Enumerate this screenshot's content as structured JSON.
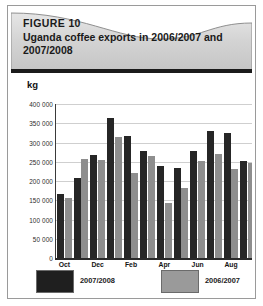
{
  "figure": {
    "label": "FIGURE 10",
    "title": "Uganda coffee exports in 2006/2007 and 2007/2008",
    "unit": "kg"
  },
  "colors": {
    "series_2007_2008": "#262626",
    "series_2006_2007": "#8e8e8e",
    "header_band": "#d2d2d2",
    "header_rule": "#1b1b1b",
    "gridline": "#cfcfcf",
    "axis": "#2a2a2a"
  },
  "legend": {
    "position": "bottom",
    "items": [
      {
        "label": "2007/2008",
        "swatch": "dark"
      },
      {
        "label": "2006/2007",
        "swatch": "gray"
      }
    ]
  },
  "chart_data": {
    "type": "bar",
    "title": "Uganda coffee exports in 2006/2007 and 2007/2008",
    "xlabel": "",
    "ylabel": "kg",
    "ylim": [
      0,
      400000
    ],
    "ytick_step": 50000,
    "ytick_labels": [
      "400 000",
      "350 000",
      "300 000",
      "250 000",
      "200 000",
      "150 000",
      "100 000",
      "50 000",
      "0"
    ],
    "ytick_values": [
      400000,
      350000,
      300000,
      250000,
      200000,
      150000,
      100000,
      50000,
      0
    ],
    "grid": true,
    "legend_position": "bottom",
    "categories": [
      "Oct",
      "Nov",
      "Dec",
      "Jan",
      "Feb",
      "Mar",
      "Apr",
      "May",
      "Jun",
      "Jul",
      "Aug",
      "Sep"
    ],
    "xtick_labels_shown": [
      "Oct",
      "Dec",
      "Feb",
      "Apr",
      "Jun",
      "Aug"
    ],
    "series": [
      {
        "name": "2007/2008",
        "color": "#262626",
        "values": [
          167000,
          207000,
          267000,
          364000,
          318000,
          277000,
          239000,
          233000,
          278000,
          329000,
          324000,
          252000
        ]
      },
      {
        "name": "2006/2007",
        "color": "#8e8e8e",
        "values": [
          157000,
          257000,
          255000,
          315000,
          220000,
          265000,
          142000,
          181000,
          252000,
          271000,
          231000,
          246000
        ]
      }
    ]
  }
}
